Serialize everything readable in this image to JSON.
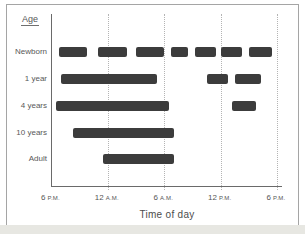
{
  "chart_data": {
    "type": "bar",
    "subtype": "horizontal-timeline-of-sleep-periods",
    "title": "",
    "ylabel": "Age",
    "xlabel": "Time of day",
    "x_axis": {
      "unit": "hours after 6 P.M.",
      "range": [
        0,
        24
      ],
      "ticks": [
        {
          "num": "6",
          "suffix": "P.M.",
          "hour": 0,
          "gridline": false
        },
        {
          "num": "12",
          "suffix": "A.M.",
          "hour": 6,
          "gridline": true
        },
        {
          "num": "6",
          "suffix": "A.M.",
          "hour": 12,
          "gridline": true
        },
        {
          "num": "12",
          "suffix": "P.M.",
          "hour": 18,
          "gridline": true
        },
        {
          "num": "6",
          "suffix": "P.M.",
          "hour": 24,
          "gridline": true
        }
      ]
    },
    "rows": [
      {
        "label": "Newborn",
        "sleep_segments_hours": [
          [
            0.75,
            3.75
          ],
          [
            5,
            8
          ],
          [
            9,
            12
          ],
          [
            12.75,
            14.5
          ],
          [
            15.25,
            17.5
          ],
          [
            18,
            20.25
          ],
          [
            21,
            23.5
          ]
        ]
      },
      {
        "label": "1 year",
        "sleep_segments_hours": [
          [
            1,
            11.25
          ],
          [
            16.5,
            18.75
          ],
          [
            19.5,
            22.25
          ]
        ]
      },
      {
        "label": "4 years",
        "sleep_segments_hours": [
          [
            0.5,
            12.5
          ],
          [
            19.25,
            21.75
          ]
        ]
      },
      {
        "label": "10 years",
        "sleep_segments_hours": [
          [
            2.25,
            13
          ]
        ]
      },
      {
        "label": "Adult",
        "sleep_segments_hours": [
          [
            5.5,
            13
          ]
        ]
      }
    ],
    "grid": "vertical dotted gridlines at 12 A.M., 6 A.M., 12 P.M. and 6 P.M.",
    "legend": "none",
    "bar_color": "#3c3c3c"
  },
  "colors": {
    "bar": "#3c3c3c",
    "gridline": "#b4b4b4",
    "axis": "#6a6a6a",
    "text": "#565656",
    "figure_border": "#a5a5a5",
    "bottom_strip": "#e7e7e2"
  }
}
